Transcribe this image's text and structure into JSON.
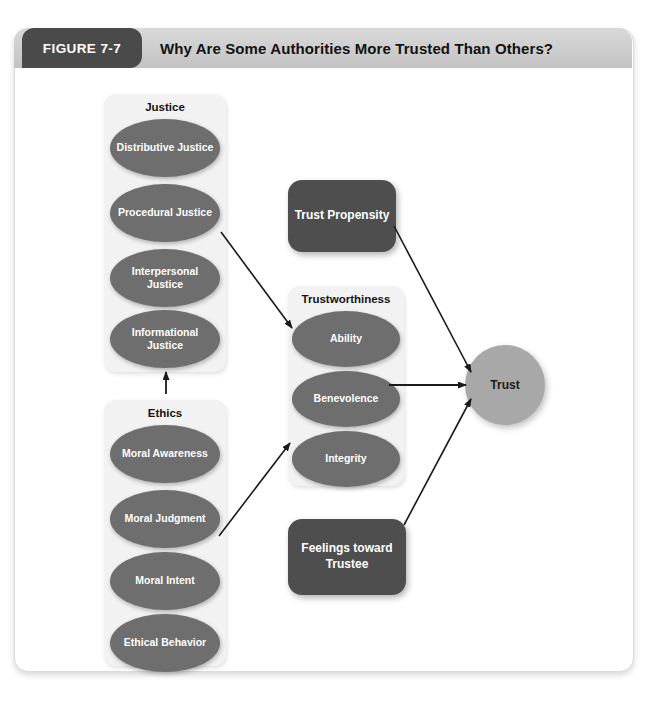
{
  "figure": {
    "tag": "FIGURE 7-7",
    "title": "Why Are Some Authorities More Trusted Than Others?"
  },
  "colors": {
    "header_band": "#cdcdcd",
    "tag_background": "#4a4a4a",
    "panel_background": "#f2f2f2",
    "ellipse_fill": "#6e6e6e",
    "dark_box_fill": "#4e4e4e",
    "trust_fill": "#a8a8a8",
    "arrow_stroke": "#1a1a1a",
    "card_background": "#ffffff"
  },
  "diagram": {
    "type": "conceptual-model",
    "groups": [
      {
        "id": "justice",
        "label": "Justice",
        "nodes": [
          {
            "id": "distributive-justice",
            "label": "Distributive Justice"
          },
          {
            "id": "procedural-justice",
            "label": "Procedural Justice"
          },
          {
            "id": "interpersonal-justice",
            "label": "Interpersonal Justice"
          },
          {
            "id": "informational-justice",
            "label": "Informational Justice"
          }
        ]
      },
      {
        "id": "ethics",
        "label": "Ethics",
        "nodes": [
          {
            "id": "moral-awareness",
            "label": "Moral Awareness"
          },
          {
            "id": "moral-judgment",
            "label": "Moral Judgment"
          },
          {
            "id": "moral-intent",
            "label": "Moral Intent"
          },
          {
            "id": "ethical-behavior",
            "label": "Ethical Behavior"
          }
        ]
      },
      {
        "id": "trustworthiness",
        "label": "Trustworthiness",
        "nodes": [
          {
            "id": "ability",
            "label": "Ability"
          },
          {
            "id": "benevolence",
            "label": "Benevolence"
          },
          {
            "id": "integrity",
            "label": "Integrity"
          }
        ]
      }
    ],
    "boxes": [
      {
        "id": "trust-propensity",
        "label": "Trust Propensity"
      },
      {
        "id": "feelings-toward-trustee",
        "label": "Feelings toward Trustee"
      }
    ],
    "outcome": {
      "id": "trust",
      "label": "Trust"
    },
    "edges": [
      {
        "id": "ethics-to-justice",
        "from": "Ethics",
        "to": "Justice",
        "style": "arrow"
      },
      {
        "id": "justice-to-trustworthiness",
        "from": "Justice",
        "to": "Trustworthiness",
        "style": "arrow"
      },
      {
        "id": "ethics-to-trustworthiness",
        "from": "Ethics",
        "to": "Trustworthiness",
        "style": "arrow"
      },
      {
        "id": "trustworthiness-to-trust",
        "from": "Trustworthiness",
        "to": "Trust",
        "style": "arrow"
      },
      {
        "id": "trust-propensity-to-trust",
        "from": "Trust Propensity",
        "to": "Trust",
        "style": "arrow"
      },
      {
        "id": "feelings-to-trust",
        "from": "Feelings toward Trustee",
        "to": "Trust",
        "style": "arrow"
      }
    ]
  }
}
